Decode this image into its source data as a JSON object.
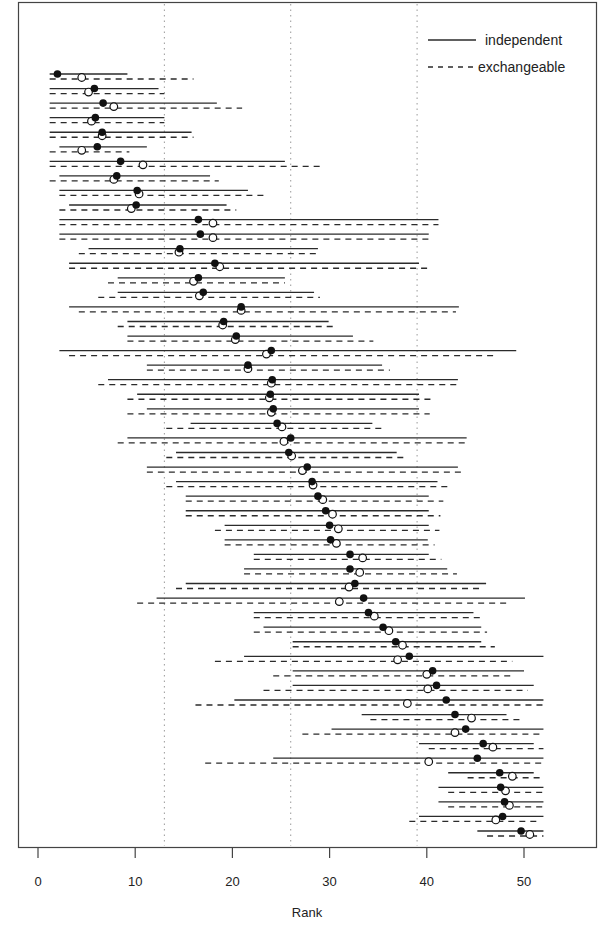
{
  "chart_data": {
    "type": "interval",
    "title": "",
    "xlabel": "Rank",
    "ylabel": "",
    "xlim": [
      -2,
      57.5
    ],
    "xticks": [
      0,
      10,
      20,
      30,
      40,
      50
    ],
    "reference_lines": [
      13,
      26,
      39
    ],
    "grid": false,
    "legend": {
      "position": "top-right",
      "entries": [
        {
          "name": "independent",
          "style": "solid",
          "marker": "filled-circle"
        },
        {
          "name": "exchangeable",
          "style": "dashed",
          "marker": "open-circle"
        }
      ]
    },
    "series_names": [
      "independent",
      "exchangeable"
    ],
    "rows": [
      {
        "ind": [
          1.2,
          9.2,
          2.0
        ],
        "exc": [
          1.2,
          16.0,
          4.5
        ]
      },
      {
        "ind": [
          1.2,
          12.4,
          5.8
        ],
        "exc": [
          1.2,
          13.0,
          5.2
        ]
      },
      {
        "ind": [
          1.2,
          18.4,
          6.7
        ],
        "exc": [
          1.2,
          21.0,
          7.8
        ]
      },
      {
        "ind": [
          1.2,
          13.0,
          5.9
        ],
        "exc": [
          1.2,
          13.0,
          5.5
        ]
      },
      {
        "ind": [
          1.2,
          15.8,
          6.6
        ],
        "exc": [
          1.2,
          16.0,
          6.6
        ]
      },
      {
        "ind": [
          2.2,
          11.2,
          6.1
        ],
        "exc": [
          1.2,
          9.4,
          4.5
        ]
      },
      {
        "ind": [
          1.2,
          25.4,
          8.5
        ],
        "exc": [
          1.2,
          29.0,
          10.8
        ]
      },
      {
        "ind": [
          2.2,
          17.7,
          8.1
        ],
        "exc": [
          1.2,
          18.6,
          7.8
        ]
      },
      {
        "ind": [
          2.2,
          21.6,
          10.2
        ],
        "exc": [
          2.2,
          23.4,
          10.4
        ]
      },
      {
        "ind": [
          3.2,
          19.4,
          10.1
        ],
        "exc": [
          2.2,
          20.4,
          9.6
        ]
      },
      {
        "ind": [
          2.2,
          41.2,
          16.5
        ],
        "exc": [
          2.2,
          41.2,
          18.0
        ]
      },
      {
        "ind": [
          2.2,
          40.2,
          16.7
        ],
        "exc": [
          2.2,
          40.5,
          18.0
        ]
      },
      {
        "ind": [
          5.2,
          28.8,
          14.6
        ],
        "exc": [
          4.2,
          29.0,
          14.5
        ]
      },
      {
        "ind": [
          3.2,
          39.2,
          18.2
        ],
        "exc": [
          3.2,
          40.2,
          18.7
        ]
      },
      {
        "ind": [
          8.2,
          25.4,
          16.5
        ],
        "exc": [
          7.2,
          25.4,
          16.0
        ]
      },
      {
        "ind": [
          8.2,
          28.4,
          17.0
        ],
        "exc": [
          6.2,
          29.0,
          16.6
        ]
      },
      {
        "ind": [
          3.2,
          43.3,
          20.9
        ],
        "exc": [
          4.2,
          43.0,
          20.9
        ]
      },
      {
        "ind": [
          9.2,
          29.9,
          19.1
        ],
        "exc": [
          8.2,
          30.5,
          19.0
        ]
      },
      {
        "ind": [
          9.2,
          32.4,
          20.4
        ],
        "exc": [
          9.2,
          34.5,
          20.3
        ]
      },
      {
        "ind": [
          2.2,
          49.2,
          24.0
        ],
        "exc": [
          3.2,
          47.0,
          23.5
        ]
      },
      {
        "ind": [
          11.2,
          35.4,
          21.6
        ],
        "exc": [
          11.2,
          36.2,
          21.6
        ]
      },
      {
        "ind": [
          7.2,
          43.2,
          24.1
        ],
        "exc": [
          6.2,
          43.3,
          24.0
        ]
      },
      {
        "ind": [
          10.2,
          39.2,
          23.9
        ],
        "exc": [
          9.2,
          40.4,
          23.8
        ]
      },
      {
        "ind": [
          11.2,
          39.2,
          24.2
        ],
        "exc": [
          9.2,
          40.3,
          24.0
        ]
      },
      {
        "ind": [
          15.7,
          34.4,
          24.6
        ],
        "exc": [
          13.2,
          35.4,
          25.1
        ]
      },
      {
        "ind": [
          9.2,
          44.1,
          26.0
        ],
        "exc": [
          8.2,
          44.1,
          25.3
        ]
      },
      {
        "ind": [
          14.2,
          36.9,
          25.8
        ],
        "exc": [
          13.2,
          37.9,
          26.1
        ]
      },
      {
        "ind": [
          11.2,
          43.2,
          27.7
        ],
        "exc": [
          11.2,
          43.9,
          27.2
        ]
      },
      {
        "ind": [
          14.2,
          41.1,
          28.2
        ],
        "exc": [
          13.2,
          42.6,
          28.3
        ]
      },
      {
        "ind": [
          15.2,
          40.2,
          28.8
        ],
        "exc": [
          15.2,
          41.7,
          29.3
        ]
      },
      {
        "ind": [
          15.2,
          40.2,
          29.6
        ],
        "exc": [
          15.2,
          41.4,
          30.3
        ]
      },
      {
        "ind": [
          19.2,
          40.2,
          30.0
        ],
        "exc": [
          18.2,
          41.3,
          30.9
        ]
      },
      {
        "ind": [
          19.2,
          40.1,
          30.1
        ],
        "exc": [
          19.2,
          40.8,
          30.7
        ]
      },
      {
        "ind": [
          22.2,
          40.2,
          32.1
        ],
        "exc": [
          22.2,
          41.5,
          33.4
        ]
      },
      {
        "ind": [
          21.2,
          42.1,
          32.1
        ],
        "exc": [
          21.2,
          43.1,
          33.1
        ]
      },
      {
        "ind": [
          15.2,
          46.1,
          32.6
        ],
        "exc": [
          14.2,
          45.4,
          32.0
        ]
      },
      {
        "ind": [
          12.2,
          50.1,
          33.5
        ],
        "exc": [
          10.2,
          48.4,
          31.0
        ]
      },
      {
        "ind": [
          22.2,
          44.8,
          34.0
        ],
        "exc": [
          22.2,
          45.5,
          34.6
        ]
      },
      {
        "ind": [
          23.2,
          45.6,
          35.5
        ],
        "exc": [
          22.2,
          46.2,
          36.1
        ]
      },
      {
        "ind": [
          26.2,
          45.6,
          36.8
        ],
        "exc": [
          26.2,
          47.0,
          37.5
        ]
      },
      {
        "ind": [
          21.2,
          52.0,
          38.2
        ],
        "exc": [
          18.2,
          48.8,
          37.0
        ]
      },
      {
        "ind": [
          26.2,
          50.0,
          40.6
        ],
        "exc": [
          24.2,
          49.0,
          40.0
        ]
      },
      {
        "ind": [
          26.2,
          51.0,
          41.0
        ],
        "exc": [
          23.2,
          50.4,
          40.1
        ]
      },
      {
        "ind": [
          20.2,
          52.0,
          42.0
        ],
        "exc": [
          16.2,
          52.0,
          38.0
        ]
      },
      {
        "ind": [
          33.3,
          48.2,
          42.9
        ],
        "exc": [
          34.2,
          50.0,
          44.6
        ]
      },
      {
        "ind": [
          30.2,
          52.0,
          44.0
        ],
        "exc": [
          27.2,
          52.0,
          42.9
        ]
      },
      {
        "ind": [
          39.2,
          51.0,
          45.8
        ],
        "exc": [
          40.2,
          52.0,
          46.8
        ]
      },
      {
        "ind": [
          24.2,
          52.0,
          45.2
        ],
        "exc": [
          17.2,
          52.0,
          40.2
        ]
      },
      {
        "ind": [
          42.2,
          51.0,
          47.5
        ],
        "exc": [
          44.2,
          51.7,
          48.8
        ]
      },
      {
        "ind": [
          41.2,
          52.0,
          47.6
        ],
        "exc": [
          42.2,
          52.0,
          48.1
        ]
      },
      {
        "ind": [
          41.2,
          52.0,
          48.0
        ],
        "exc": [
          42.2,
          52.0,
          48.5
        ]
      },
      {
        "ind": [
          39.2,
          52.0,
          47.8
        ],
        "exc": [
          38.2,
          51.4,
          47.1
        ]
      },
      {
        "ind": [
          45.2,
          52.0,
          49.7
        ],
        "exc": [
          46.2,
          52.0,
          50.6
        ]
      }
    ]
  },
  "axis": {
    "x_tick_labels": [
      "0",
      "10",
      "20",
      "30",
      "40",
      "50"
    ],
    "x_title": "Rank"
  },
  "legend": {
    "independent_label": "independent",
    "exchangeable_label": "exchangeable"
  },
  "style": {
    "line_color": "#2b2b2b",
    "point_fill": "#111111",
    "open_point_fill": "#ffffff",
    "ref_line_color": "#999999",
    "frame_color": "#444444"
  }
}
